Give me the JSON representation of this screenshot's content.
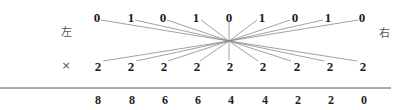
{
  "diagram": {
    "left_label": "左",
    "right_label": "右",
    "cross_label": "×",
    "top_row": [
      "0",
      "1",
      "0",
      "1",
      "0",
      "1",
      "0",
      "1",
      "0"
    ],
    "bottom_row": [
      "2",
      "2",
      "2",
      "2",
      "2",
      "2",
      "2",
      "2",
      "2"
    ],
    "result_row": [
      "8",
      "8",
      "6",
      "6",
      "4",
      "4",
      "2",
      "2",
      "0"
    ],
    "line_color": "#8a8a8a",
    "rule_color": "#555555"
  }
}
